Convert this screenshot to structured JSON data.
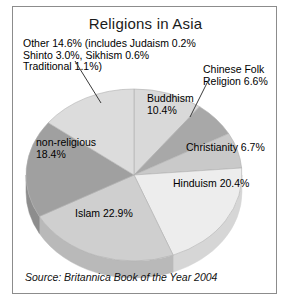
{
  "chart_data": {
    "type": "pie",
    "title": "Religions in Asia",
    "source": "Source: Britannica Book of the Year 2004",
    "categories": [
      "Buddhism",
      "Chinese Folk Religion",
      "Christianity",
      "Hinduism",
      "Islam",
      "non-religious",
      "Other"
    ],
    "values": [
      10.4,
      6.6,
      6.7,
      20.4,
      22.9,
      18.4,
      14.6
    ],
    "unit": "%",
    "legend": "none",
    "grid": false,
    "slices": [
      {
        "name": "Buddhism",
        "value": 10.4,
        "label": "Buddhism\n10.4%",
        "color": "#d9d9d9",
        "side": "#c2c2c2"
      },
      {
        "name": "Chinese Folk Religion",
        "value": 6.6,
        "label": "Chinese Folk\nReligion 6.6%",
        "color": "#a8a8a8",
        "side": "#949494"
      },
      {
        "name": "Christianity",
        "value": 6.7,
        "label": "Christianity 6.7%",
        "color": "#c9c9c9",
        "side": "#b4b4b4"
      },
      {
        "name": "Hinduism",
        "value": 20.4,
        "label": "Hinduism 20.4%",
        "color": "#ededed",
        "side": "#d6d6d6"
      },
      {
        "name": "Islam",
        "value": 22.9,
        "label": "Islam 22.9%",
        "color": "#cfcfcf",
        "side": "#b9b9b9"
      },
      {
        "name": "non-religious",
        "value": 18.4,
        "label": "non-religious\n18.4%",
        "color": "#a0a0a0",
        "side": "#8d8d8d"
      },
      {
        "name": "Other",
        "value": 14.6,
        "label": "",
        "color": "#dcdcdc",
        "side": "#c5c5c5"
      }
    ],
    "annotations": {
      "other_note": "Other 14.6% (includes Judaism 0.2%\nShinto 3.0%, Sikhism 0.6%\nTraditional 1.1%)",
      "chinese_folk_note": "Chinese Folk\nReligion 6.6%"
    },
    "labels": {
      "buddhism": "Buddhism\n10.4%",
      "christianity": "Christianity 6.7%",
      "hinduism": "Hinduism 20.4%",
      "islam": "Islam 22.9%",
      "non_religious": "non-religious\n18.4%"
    },
    "colors": {
      "frame": "#8c8c8c",
      "background": "#ffffff",
      "text": "#000000",
      "leader_line": "#3a3a3a"
    }
  }
}
